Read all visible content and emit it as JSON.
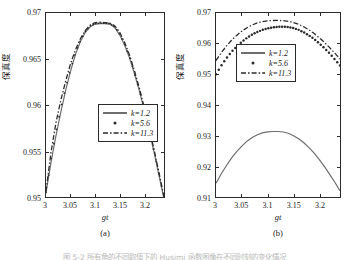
{
  "figure": {
    "caption_cut": "图 5-2   所有角的不同取值下的 Husimi 函数图像在不同时刻的变化情况",
    "ylabel": "保真度",
    "xlabel": "gt"
  },
  "panels": [
    {
      "id": "a",
      "sublabel": "(a)",
      "yticks": [
        "0.95",
        "0.955",
        "0.96",
        "0.965",
        "0.97"
      ],
      "xticks": [
        "3",
        "3.05",
        "3.1",
        "3.15",
        "3.2"
      ],
      "legend": [
        {
          "label": "k=1.2",
          "style": "solid"
        },
        {
          "label": "k=5.6",
          "style": "dotted"
        },
        {
          "label": "k=11.3",
          "style": "dashdot"
        }
      ]
    },
    {
      "id": "b",
      "sublabel": "(b)",
      "yticks": [
        "0.91",
        "0.92",
        "0.93",
        "0.94",
        "0.95",
        "0.96",
        "0.97"
      ],
      "xticks": [
        "3",
        "3.05",
        "3.1",
        "3.15",
        "3.2"
      ],
      "legend": [
        {
          "label": "k=1.2",
          "style": "solid"
        },
        {
          "label": "k=5.6",
          "style": "dotted"
        },
        {
          "label": "k=11.3",
          "style": "dashdot"
        }
      ]
    }
  ],
  "chart_data": [
    {
      "type": "line",
      "panel": "(a)",
      "title": "",
      "xlabel": "gt",
      "ylabel": "保真度",
      "xlim": [
        3.0,
        3.24
      ],
      "ylim": [
        0.95,
        0.97
      ],
      "grid": false,
      "legend_position": "center-right",
      "x": [
        3.0,
        3.01,
        3.02,
        3.03,
        3.04,
        3.05,
        3.06,
        3.07,
        3.08,
        3.09,
        3.1,
        3.11,
        3.12,
        3.13,
        3.14,
        3.15,
        3.16,
        3.17,
        3.18,
        3.19,
        3.2,
        3.21,
        3.22,
        3.23,
        3.24
      ],
      "series": [
        {
          "name": "k=1.2",
          "style": "solid",
          "values": [
            0.9505,
            0.9537,
            0.9566,
            0.9592,
            0.9616,
            0.9637,
            0.9655,
            0.9669,
            0.9679,
            0.9685,
            0.9688,
            0.96885,
            0.96885,
            0.9688,
            0.9684,
            0.9676,
            0.9665,
            0.9651,
            0.9634,
            0.9615,
            0.9594,
            0.9572,
            0.9548,
            0.9523,
            0.9498
          ]
        },
        {
          "name": "k=5.6",
          "style": "dotted",
          "values": [
            0.9505,
            0.954,
            0.957,
            0.9596,
            0.9619,
            0.9639,
            0.9657,
            0.967,
            0.968,
            0.9686,
            0.96885,
            0.9689,
            0.9689,
            0.96885,
            0.9685,
            0.9677,
            0.9666,
            0.9652,
            0.9635,
            0.9616,
            0.9595,
            0.9573,
            0.9549,
            0.9524,
            0.9499
          ]
        },
        {
          "name": "k=11.3",
          "style": "dashdot",
          "values": [
            0.9506,
            0.9548,
            0.958,
            0.9605,
            0.9626,
            0.9645,
            0.966,
            0.9672,
            0.9681,
            0.9687,
            0.96895,
            0.969,
            0.96895,
            0.9689,
            0.9686,
            0.9679,
            0.9668,
            0.9654,
            0.9637,
            0.9618,
            0.9597,
            0.9575,
            0.9551,
            0.9526,
            0.95
          ]
        }
      ]
    },
    {
      "type": "line",
      "panel": "(b)",
      "title": "",
      "xlabel": "gt",
      "ylabel": "保真度",
      "xlim": [
        3.0,
        3.24
      ],
      "ylim": [
        0.91,
        0.97
      ],
      "grid": false,
      "legend_position": "upper-center",
      "x": [
        3.0,
        3.01,
        3.02,
        3.03,
        3.04,
        3.05,
        3.06,
        3.07,
        3.08,
        3.09,
        3.1,
        3.11,
        3.12,
        3.13,
        3.14,
        3.15,
        3.16,
        3.17,
        3.18,
        3.19,
        3.2,
        3.21,
        3.22,
        3.23,
        3.24
      ],
      "series": [
        {
          "name": "k=1.2",
          "style": "solid",
          "values": [
            0.9145,
            0.9175,
            0.9202,
            0.9227,
            0.9248,
            0.9266,
            0.9282,
            0.9294,
            0.9303,
            0.9309,
            0.93125,
            0.93135,
            0.93135,
            0.9312,
            0.9308,
            0.93,
            0.929,
            0.9277,
            0.9261,
            0.9243,
            0.9222,
            0.9199,
            0.9174,
            0.9148,
            0.912
          ]
        },
        {
          "name": "k=5.6",
          "style": "dotted",
          "values": [
            0.95,
            0.9528,
            0.9552,
            0.9573,
            0.9591,
            0.9606,
            0.9619,
            0.963,
            0.9638,
            0.9645,
            0.965,
            0.9653,
            0.96548,
            0.96552,
            0.9654,
            0.9651,
            0.9645,
            0.9637,
            0.9627,
            0.9615,
            0.9601,
            0.9585,
            0.9568,
            0.9549,
            0.9529
          ]
        },
        {
          "name": "k=11.3",
          "style": "dashdot",
          "values": [
            0.9545,
            0.957,
            0.9592,
            0.9611,
            0.9627,
            0.9641,
            0.9652,
            0.9661,
            0.9668,
            0.9672,
            0.96745,
            0.96755,
            0.96758,
            0.96752,
            0.9673,
            0.9669,
            0.9663,
            0.9655,
            0.9645,
            0.9633,
            0.9619,
            0.9604,
            0.9587,
            0.9569,
            0.955
          ]
        }
      ]
    }
  ]
}
